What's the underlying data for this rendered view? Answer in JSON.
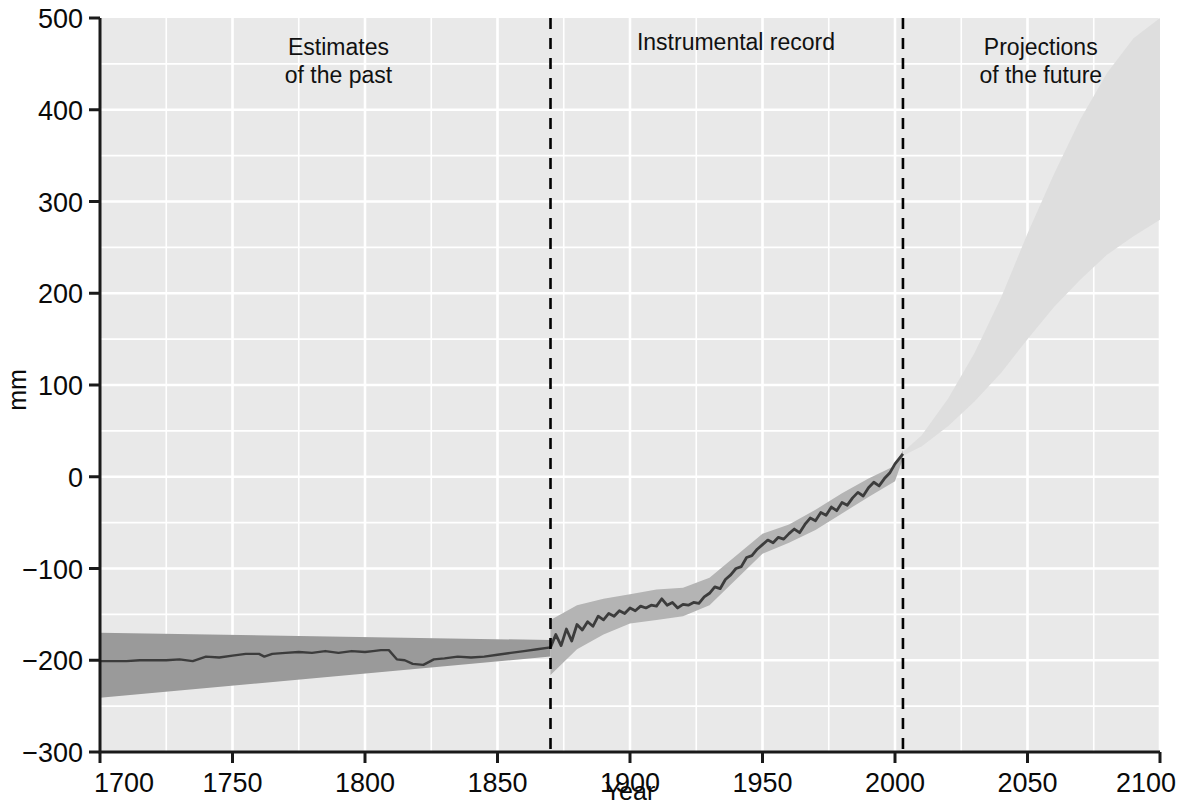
{
  "chart_data": {
    "type": "line",
    "title": "",
    "xlabel": "Year",
    "ylabel": "mm",
    "xlim": [
      1700,
      2100
    ],
    "ylim": [
      -300,
      500
    ],
    "grid": true,
    "legend_position": "none",
    "x_ticks": [
      "1700",
      "1750",
      "1800",
      "1850",
      "1900",
      "1950",
      "2000",
      "2050",
      "2100"
    ],
    "x_tick_values": [
      1700,
      1750,
      1800,
      1850,
      1900,
      1950,
      2000,
      2050,
      2100
    ],
    "y_ticks": [
      "-300",
      "-200",
      "-100",
      "0",
      "100",
      "200",
      "300",
      "400",
      "500"
    ],
    "y_tick_values": [
      -300,
      -200,
      -100,
      0,
      100,
      200,
      300,
      400,
      500
    ],
    "annotations": [
      {
        "id": "estimates",
        "line1": "Estimates",
        "line2": "of the past",
        "x": 1790,
        "y": 460
      },
      {
        "id": "instrumental",
        "line1": "Instrumental record",
        "line2": "",
        "x": 1940,
        "y": 465
      },
      {
        "id": "projections",
        "line1": "Projections",
        "line2": "of the future",
        "x": 2055,
        "y": 460
      }
    ],
    "divider_years": [
      1870,
      2003
    ],
    "series": [
      {
        "name": "Estimates of the past (reconstruction)",
        "kind": "line",
        "segment": "past",
        "x": [
          1700,
          1705,
          1710,
          1715,
          1720,
          1725,
          1730,
          1735,
          1740,
          1745,
          1750,
          1755,
          1760,
          1762,
          1765,
          1770,
          1775,
          1780,
          1785,
          1790,
          1795,
          1800,
          1803,
          1806,
          1809,
          1812,
          1815,
          1818,
          1822,
          1826,
          1830,
          1835,
          1840,
          1845,
          1850,
          1855,
          1860,
          1865,
          1870
        ],
        "y": [
          -201,
          -201,
          -201,
          -200,
          -200,
          -200,
          -199,
          -201,
          -196,
          -197,
          -195,
          -193,
          -193,
          -196,
          -193,
          -192,
          -191,
          -192,
          -190,
          -192,
          -190,
          -191,
          -190,
          -189,
          -189,
          -199,
          -200,
          -204,
          -205,
          -199,
          -198,
          -196,
          -197,
          -196,
          -194,
          -192,
          -190,
          -188,
          -186
        ]
      },
      {
        "name": "Estimates of the past (uncertainty band)",
        "kind": "band",
        "segment": "past",
        "x": [
          1700,
          1870
        ],
        "upper": [
          -170,
          -178
        ],
        "lower": [
          -241,
          -196
        ]
      },
      {
        "name": "Instrumental record (tide gauge + satellite)",
        "kind": "line",
        "segment": "instrumental",
        "x": [
          1870,
          1872,
          1874,
          1876,
          1878,
          1880,
          1882,
          1884,
          1886,
          1888,
          1890,
          1892,
          1894,
          1896,
          1898,
          1900,
          1902,
          1904,
          1906,
          1908,
          1910,
          1912,
          1914,
          1916,
          1918,
          1920,
          1922,
          1924,
          1926,
          1928,
          1930,
          1932,
          1934,
          1936,
          1938,
          1940,
          1942,
          1944,
          1946,
          1948,
          1950,
          1952,
          1954,
          1956,
          1958,
          1960,
          1962,
          1964,
          1966,
          1968,
          1970,
          1972,
          1974,
          1976,
          1978,
          1980,
          1982,
          1984,
          1986,
          1988,
          1990,
          1992,
          1994,
          1996,
          1998,
          2000,
          2003
        ],
        "y": [
          -186,
          -172,
          -184,
          -166,
          -179,
          -161,
          -167,
          -158,
          -163,
          -152,
          -156,
          -149,
          -152,
          -146,
          -149,
          -143,
          -146,
          -141,
          -143,
          -140,
          -141,
          -133,
          -140,
          -137,
          -143,
          -139,
          -140,
          -137,
          -138,
          -131,
          -127,
          -120,
          -122,
          -112,
          -107,
          -100,
          -98,
          -88,
          -86,
          -79,
          -74,
          -69,
          -72,
          -66,
          -68,
          -62,
          -57,
          -61,
          -52,
          -45,
          -48,
          -39,
          -42,
          -33,
          -37,
          -28,
          -31,
          -23,
          -17,
          -21,
          -12,
          -6,
          -10,
          -2,
          4,
          14,
          25
        ]
      },
      {
        "name": "Instrumental record (uncertainty band)",
        "kind": "band",
        "segment": "instrumental",
        "x": [
          1870,
          1880,
          1890,
          1900,
          1910,
          1920,
          1930,
          1940,
          1950,
          1960,
          1970,
          1980,
          1990,
          2000,
          2003
        ],
        "upper": [
          -156,
          -140,
          -133,
          -128,
          -123,
          -121,
          -110,
          -86,
          -62,
          -52,
          -36,
          -18,
          -2,
          12,
          29
        ],
        "lower": [
          -216,
          -188,
          -172,
          -160,
          -156,
          -152,
          -140,
          -112,
          -84,
          -72,
          -58,
          -40,
          -22,
          -5,
          20
        ]
      },
      {
        "name": "Projections of the future",
        "kind": "band",
        "segment": "projection",
        "x": [
          2003,
          2010,
          2020,
          2030,
          2040,
          2050,
          2060,
          2070,
          2080,
          2090,
          2100
        ],
        "upper": [
          27,
          45,
          85,
          135,
          195,
          265,
          330,
          390,
          440,
          478,
          500
        ],
        "lower": [
          23,
          33,
          55,
          82,
          113,
          150,
          185,
          215,
          242,
          262,
          280
        ]
      }
    ]
  },
  "colors": {
    "plot_background": "#e9e9e9",
    "grid": "#ffffff",
    "axis": "#1a1a1a",
    "past_band": "#9a9a9a",
    "instrumental_band": "#b4b4b4",
    "projection_band": "#dedede",
    "line": "#3c3c3c",
    "text": "#0a0a0a",
    "divider": "#000000"
  }
}
